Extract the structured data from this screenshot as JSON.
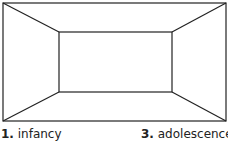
{
  "diagram": {
    "type": "room-perspective-box",
    "stroke_color": "#222222",
    "outer_rect": {
      "x1": 3,
      "y1": 3,
      "x2": 226,
      "y2": 121
    },
    "inner_rect": {
      "x1": 59,
      "y1": 32,
      "x2": 172,
      "y2": 92
    }
  },
  "labels": [
    {
      "number": "1.",
      "text": "infancy"
    },
    {
      "number": "3.",
      "text": "adolescence"
    }
  ]
}
